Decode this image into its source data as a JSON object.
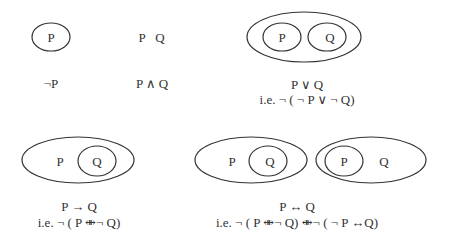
{
  "diagram": {
    "title": "",
    "panels": [
      {
        "id": "not-p",
        "sets": [
          "P"
        ],
        "formula": "¬P",
        "equivalence": ""
      },
      {
        "id": "and",
        "sets": [
          "P",
          "Q"
        ],
        "formula": "P ∧ Q",
        "equivalence": ""
      },
      {
        "id": "or",
        "sets": [
          "P",
          "Q"
        ],
        "formula": "P ∨ Q",
        "equivalence": "i.e. ¬ ( ¬ P ∨ ¬ Q)"
      },
      {
        "id": "implies",
        "sets": [
          "P",
          "Q"
        ],
        "formula": "P → Q",
        "equivalence": "i.e. ¬ ( P ⇼¬ Q)"
      },
      {
        "id": "iff",
        "sets": [
          "P",
          "Q",
          "P",
          "Q"
        ],
        "formula": "P ↔ Q",
        "equivalence": "i.e. ¬ ( P ⇼¬ Q) ⇼¬ ( ¬ P ↔Q)"
      }
    ],
    "stroke_color": "#333333",
    "background": "#ffffff"
  }
}
